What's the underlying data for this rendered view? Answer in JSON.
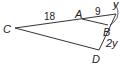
{
  "diagram": {
    "type": "geometry-triangle",
    "points": {
      "C": {
        "label": "C"
      },
      "A": {
        "label": "A"
      },
      "B": {
        "label": "B"
      },
      "D": {
        "label": "D"
      }
    },
    "segment_labels": {
      "CA": "18",
      "A_apex": "9",
      "apex_B": "y",
      "BD": "2y"
    },
    "colors": {
      "stroke": "#333333",
      "text": "#222222",
      "background": "#ffffff"
    }
  }
}
